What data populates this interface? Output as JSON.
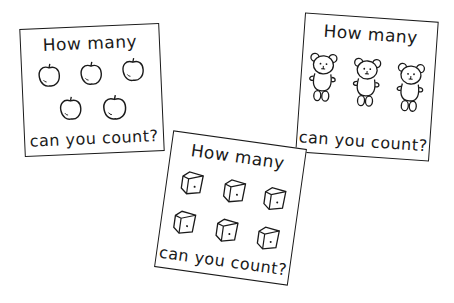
{
  "cards": [
    {
      "id": "apples",
      "title": "How many",
      "footer": "can you count?",
      "item_icon": "apple-icon",
      "item_count": 5,
      "layout": "3 top, 2 bottom"
    },
    {
      "id": "bears",
      "title": "How many",
      "footer": "can you count?",
      "item_icon": "teddy-bear-icon",
      "item_count": 3,
      "layout": "1 row of 3"
    },
    {
      "id": "dice",
      "title": "How many",
      "footer": "can you count?",
      "item_icon": "die-cube-icon",
      "item_count": 6,
      "layout": "2 rows of 3"
    }
  ],
  "colors": {
    "ink": "#1a1a1a",
    "paper": "#ffffff"
  }
}
